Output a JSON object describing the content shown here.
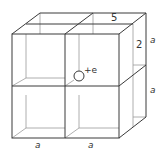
{
  "diagram": {
    "colors": {
      "line": "#3a3a3a",
      "hidden_line": "#9a9a9a",
      "text": "#333333",
      "background": "#ffffff"
    },
    "labels": {
      "charge": "+e",
      "top_depth": "5",
      "side_depth": "2",
      "right_upper_edge": "a",
      "right_lower_edge": "a",
      "bottom_left_edge": "a",
      "bottom_right_edge": "a"
    }
  }
}
